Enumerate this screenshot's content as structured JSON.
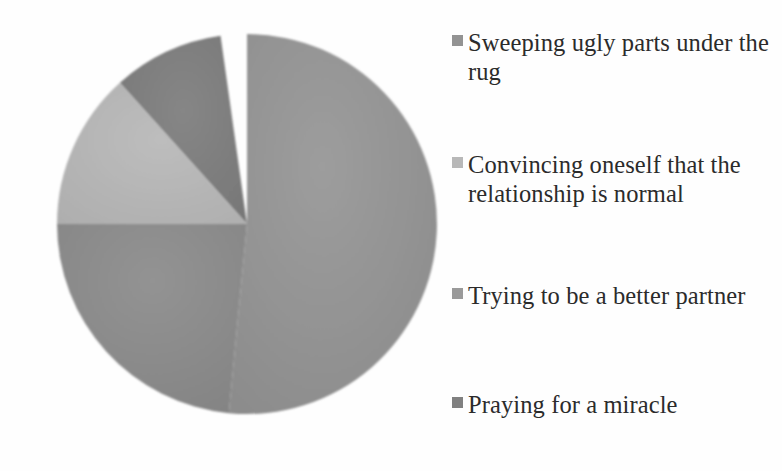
{
  "chart_data": {
    "type": "pie",
    "title": "",
    "subtitle": "",
    "xlabel": "",
    "ylabel": "",
    "grid": false,
    "legend_position": "right",
    "start_angle_deg": 0,
    "direction": "clockwise",
    "categories": [
      "Sweeping ugly parts under the rug",
      "Convincing oneself that the relationship is normal",
      "Trying to be a better partner",
      "Praying for a miracle"
    ],
    "values": [
      51.5,
      9.5,
      13.5,
      25.5
    ],
    "units": "percent",
    "slices": [
      {
        "label": "Sweeping ugly parts under the rug",
        "value": 51.5,
        "start_deg": 0,
        "end_deg": 185.5,
        "color": "#939393"
      },
      {
        "label": "Convincing oneself that the relationship is normal",
        "value": 9.5,
        "start_deg": 318,
        "end_deg": 352,
        "color": "#7d7d7d"
      },
      {
        "label": "Trying to be a better partner",
        "value": 13.5,
        "start_deg": 270,
        "end_deg": 318,
        "color": "#b5b5b5"
      },
      {
        "label": "Praying for a miracle",
        "value": 25.5,
        "start_deg": 185.5,
        "end_deg": 270,
        "color": "#8a8a8a"
      }
    ],
    "geometry": {
      "center_x": 247,
      "center_y": 224,
      "radius": 190
    }
  },
  "legend": {
    "items": [
      {
        "label": "Sweeping ugly parts under the rug",
        "color": "#939393"
      },
      {
        "label": "Convincing oneself that the relationship is normal",
        "color": "#b8b8b8"
      },
      {
        "label": "Trying to be a better partner",
        "color": "#9a9a9a"
      },
      {
        "label": "Praying for a miracle",
        "color": "#808080"
      }
    ]
  },
  "colors": {
    "background": "#fefefe",
    "text": "#2b2b2b",
    "slice_1": "#939393",
    "slice_2": "#7d7d7d",
    "slice_3": "#b5b5b5",
    "slice_4": "#8a8a8a"
  }
}
